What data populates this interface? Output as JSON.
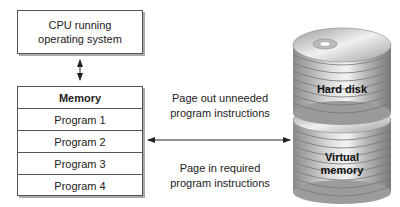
{
  "cpu": {
    "line1": "CPU running",
    "line2": "operating system"
  },
  "memory": {
    "title": "Memory",
    "programs": [
      "Program 1",
      "Program 2",
      "Program 3",
      "Program 4"
    ]
  },
  "labels": {
    "page_out_1": "Page out unneeded",
    "page_out_2": "program instructions",
    "page_in_1": "Page in required",
    "page_in_2": "program instructions"
  },
  "disk": {
    "hard_disk": "Hard disk",
    "virtual_1": "Virtual",
    "virtual_2": "memory"
  }
}
